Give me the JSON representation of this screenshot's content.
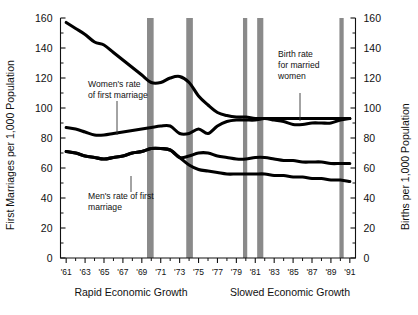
{
  "chart_data": {
    "type": "line",
    "title": "",
    "xlabel": "",
    "ylabel": "First Marriages per 1,000 Population",
    "y2label": "Births per 1,000 Population",
    "xlim": [
      1960.4,
      1991.6
    ],
    "ylim": [
      0,
      160
    ],
    "y2lim": [
      0,
      160
    ],
    "grid": false,
    "legend": "annotations-inline",
    "x_tick_labels": [
      "'61",
      "'63",
      "'65",
      "'67",
      "'69",
      "'71",
      "'73",
      "'75",
      "'77",
      "'79",
      "'81",
      "'83",
      "'85",
      "'87",
      "'89",
      "'91"
    ],
    "x_tick_values": [
      1961,
      1963,
      1965,
      1967,
      1969,
      1971,
      1973,
      1975,
      1977,
      1979,
      1981,
      1983,
      1985,
      1987,
      1989,
      1991
    ],
    "x_minor_values": [
      1962,
      1964,
      1966,
      1968,
      1970,
      1972,
      1974,
      1976,
      1978,
      1980,
      1982,
      1984,
      1986,
      1988,
      1990
    ],
    "y_tick_labels": [
      "0",
      "20",
      "40",
      "60",
      "80",
      "100",
      "120",
      "140",
      "160"
    ],
    "y_tick_values": [
      0,
      20,
      40,
      60,
      80,
      100,
      120,
      140,
      160
    ],
    "y2_tick_labels": [
      "0",
      "20",
      "40",
      "60",
      "80",
      "100",
      "120",
      "140",
      "160"
    ],
    "y2_tick_values": [
      0,
      20,
      40,
      60,
      80,
      100,
      120,
      140,
      160
    ],
    "x": [
      1961,
      1962,
      1963,
      1964,
      1965,
      1966,
      1967,
      1968,
      1969,
      1970,
      1971,
      1972,
      1973,
      1974,
      1975,
      1976,
      1977,
      1978,
      1979,
      1980,
      1981,
      1982,
      1983,
      1984,
      1985,
      1986,
      1987,
      1988,
      1989,
      1990,
      1991
    ],
    "series": [
      {
        "name": "Women's rate of first marriage",
        "axis": "left",
        "values": [
          157,
          153,
          149,
          144,
          142,
          137,
          132,
          127,
          122,
          117,
          117,
          120,
          121,
          117,
          108,
          102,
          97,
          95,
          94,
          94,
          93,
          93,
          93,
          93,
          93,
          93,
          93,
          93,
          93,
          93,
          93
        ]
      },
      {
        "name": "Birth rate for married women",
        "axis": "right",
        "values": [
          87,
          86,
          84,
          82,
          82,
          83,
          84,
          85,
          86,
          87,
          88,
          88,
          83,
          83,
          86,
          83,
          88,
          91,
          92,
          92,
          92,
          93,
          92,
          91,
          89,
          89,
          90,
          90,
          90,
          92,
          93
        ]
      },
      {
        "name": "Men's rate of first marriage",
        "axis": "left",
        "values": [
          71,
          70,
          68,
          67,
          66,
          67,
          68,
          70,
          71,
          73,
          73,
          72,
          67,
          68,
          70,
          70,
          68,
          67,
          66,
          66,
          67,
          67,
          66,
          65,
          65,
          64,
          64,
          64,
          63,
          63,
          63
        ]
      },
      {
        "name": "Men's rate of first marriage (lower)",
        "axis": "left",
        "values": [
          71,
          70,
          68,
          67,
          66,
          67,
          68,
          70,
          71,
          73,
          73,
          72,
          67,
          62,
          59,
          58,
          57,
          56,
          56,
          56,
          56,
          56,
          55,
          55,
          54,
          54,
          53,
          53,
          52,
          52,
          51
        ]
      }
    ],
    "recession_bands": [
      {
        "start": 1969.55,
        "end": 1970.25
      },
      {
        "start": 1973.7,
        "end": 1974.4
      },
      {
        "start": 1979.7,
        "end": 1980.15
      },
      {
        "start": 1981.2,
        "end": 1981.85
      },
      {
        "start": 1989.9,
        "end": 1990.35
      }
    ],
    "annotations": [
      {
        "name": "womens-rate-label",
        "text_lines": [
          "Women's rate",
          "of first marriage"
        ],
        "x_px": 88,
        "y_px": 87
      },
      {
        "name": "mens-rate-label",
        "text_lines": [
          "Men's rate of first",
          "marriage"
        ],
        "x_px": 88,
        "y_px": 199
      },
      {
        "name": "birth-rate-label",
        "text_lines": [
          "Birth rate",
          "for married",
          "women"
        ],
        "x_px": 278,
        "y_px": 57
      }
    ],
    "captions": [
      {
        "name": "rapid-growth-caption",
        "text": "Rapid Economic Growth",
        "x_px": 131,
        "y_px": 296
      },
      {
        "name": "slowed-growth-caption",
        "text": "Slowed Economic Growth",
        "x_px": 290,
        "y_px": 296
      }
    ]
  }
}
